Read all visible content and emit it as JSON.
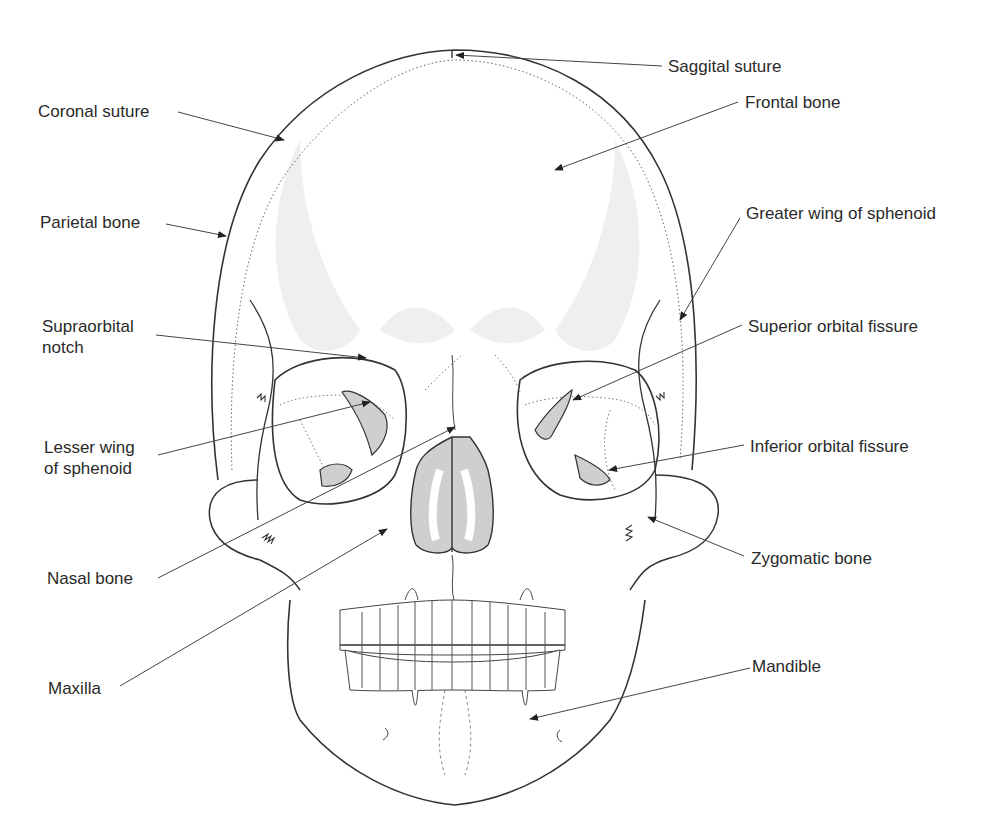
{
  "colors": {
    "outline": "#333333",
    "fill_gray": "#cfcfcf",
    "shade": "#efefef",
    "leader": "#444444"
  },
  "labels": {
    "saggital_suture": "Saggital suture",
    "coronal_suture": "Coronal suture",
    "frontal_bone": "Frontal bone",
    "parietal_bone": "Parietal bone",
    "greater_wing_of_sphenoid": "Greater wing of sphenoid",
    "supraorbital_notch_line1": "Supraorbital",
    "supraorbital_notch_line2": "notch",
    "superior_orbital_fissure": "Superior orbital fissure",
    "lesser_wing_line1": "Lesser wing",
    "lesser_wing_line2": "of sphenoid",
    "inferior_orbital_fissure": "Inferior orbital fissure",
    "nasal_bone": "Nasal bone",
    "zygomatic_bone": "Zygomatic bone",
    "maxilla": "Maxilla",
    "mandible": "Mandible"
  }
}
